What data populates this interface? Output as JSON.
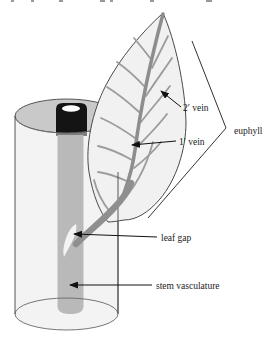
{
  "figure": {
    "type": "botanical-diagram",
    "labels": {
      "secondary_vein": "2′ vein",
      "primary_vein": "1′ vein",
      "euphyll": "euphyll",
      "leaf_gap": "leaf gap",
      "stem_vasculature": "stem vasculature"
    },
    "colors": {
      "leaf_fill": "#f1f1f1",
      "leaf_outline": "#4a4a4a",
      "vein_gray": "#9c9c9c",
      "midrib_gray": "#8d8d8d",
      "petiole_gray": "#8f8f8f",
      "stem_gray": "#8a8a8a",
      "stem_cap_black": "#141414",
      "cap_highlight": "#ffffff",
      "cylinder_top_fill": "#c9c9c9",
      "cylinder_body_fill": "#e8e8e8",
      "arrow_color": "#111111",
      "background": "#ffffff"
    }
  }
}
